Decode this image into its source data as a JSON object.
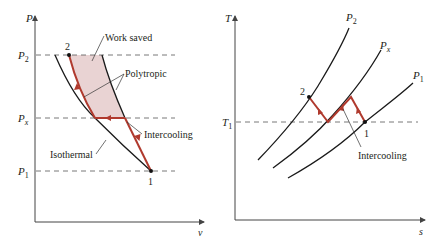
{
  "colors": {
    "process": "#b03a2e",
    "curve": "#1a1a1a",
    "axis": "#555555",
    "dash": "#555555",
    "shade": "#e9d3d3",
    "text": "#231f20"
  },
  "pv_diagram": {
    "y_axis_label": "P",
    "x_axis_label": "v",
    "pressure_labels": {
      "p2": "P",
      "p2_sub": "2",
      "px": "P",
      "px_sub": "x",
      "p1": "P",
      "p1_sub": "1"
    },
    "state_labels": {
      "state2": "2",
      "state1": "1"
    },
    "annotations": {
      "work_saved": "Work saved",
      "polytropic": "Polytropic",
      "intercooling": "Intercooling",
      "isothermal": "Isothermal"
    }
  },
  "ts_diagram": {
    "y_axis_label": "T",
    "x_axis_label": "s",
    "temperature_label": "T",
    "temperature_sub": "1",
    "isobar_labels": {
      "p2": "P",
      "p2_sub": "2",
      "px": "P",
      "px_sub": "x",
      "p1": "P",
      "p1_sub": "1"
    },
    "state_labels": {
      "state2": "2",
      "state1": "1"
    },
    "annotations": {
      "intercooling": "Intercooling"
    }
  }
}
